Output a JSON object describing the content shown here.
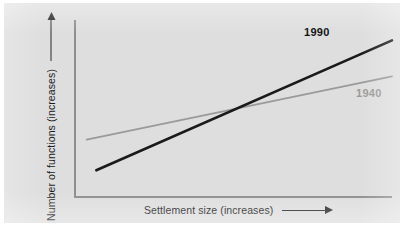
{
  "chart_data": {
    "type": "line",
    "title": "",
    "xlabel": "Settlement size (increases)",
    "ylabel": "Number of functions (increases)",
    "xlim": [
      0,
      100
    ],
    "ylim": [
      0,
      100
    ],
    "grid": false,
    "legend_position": "inline-end-of-line",
    "axis_arrows": {
      "x": "right-arrow",
      "y": "up-arrow"
    },
    "annotations": [
      {
        "text": "1990",
        "style": "bold-black",
        "near_series": "1990"
      },
      {
        "text": "1940",
        "style": "bold-gray",
        "near_series": "1940"
      }
    ],
    "series": [
      {
        "name": "1990",
        "color": "#1a1a1a",
        "width": 2.6,
        "x": [
          7,
          100
        ],
        "values": [
          15,
          91
        ],
        "description": "steeper line: starts low at small settlement size, rises sharply"
      },
      {
        "name": "1940",
        "color": "#9a9a9a",
        "width": 1.8,
        "x": [
          4,
          100
        ],
        "values": [
          33,
          70
        ],
        "description": "shallower line: starts higher, rises gently"
      }
    ],
    "intersection": {
      "x": 40,
      "y": 52,
      "note": "the 1990 line crosses above the 1940 line near mid-range"
    }
  },
  "colors": {
    "background": "#dedede",
    "page": "#ffffff",
    "axis": "#8e8e8e",
    "series_1990": "#1a1a1a",
    "series_1940": "#9a9a9a",
    "text": "#1c1c1c"
  },
  "axes": {
    "x_label": "Settlement size (increases)",
    "y_label": "Number of functions (increases)"
  },
  "labels": {
    "line_1990": "1990",
    "line_1940": "1940"
  }
}
